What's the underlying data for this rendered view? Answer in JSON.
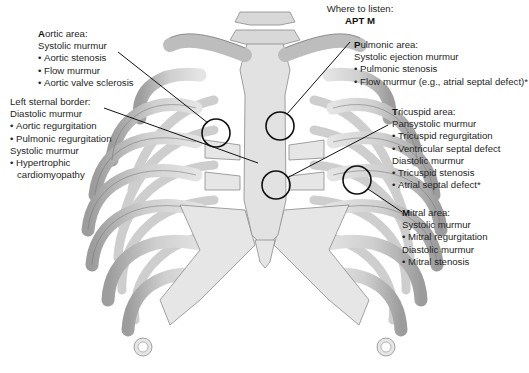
{
  "header": {
    "title": "Where to listen:",
    "mnemonic": "APT M"
  },
  "areas": {
    "aortic": {
      "initial": "A",
      "rest": "ortic area:",
      "lines": [
        {
          "text": "Systolic murmur",
          "bullet": false
        },
        {
          "text": "Aortic stenosis",
          "bullet": true
        },
        {
          "text": "Flow murmur",
          "bullet": true
        },
        {
          "text": "Aortic valve sclerosis",
          "bullet": true
        }
      ]
    },
    "left_sternal_border": {
      "initial": "",
      "rest": "Left sternal border:",
      "lines": [
        {
          "text": "Diastolic murmur",
          "bullet": false
        },
        {
          "text": "Aortic regurgitation",
          "bullet": true
        },
        {
          "text": "Pulmonic regurgitation",
          "bullet": true
        },
        {
          "text": "Systolic murmur",
          "bullet": false
        },
        {
          "text": "Hypertrophic",
          "bullet": true
        },
        {
          "text": "cardiomyopathy",
          "bullet": false
        }
      ]
    },
    "pulmonic": {
      "initial": "P",
      "rest": "ulmonic area:",
      "lines": [
        {
          "text": "Systolic ejection murmur",
          "bullet": false
        },
        {
          "text": "Pulmonic stenosis",
          "bullet": true
        },
        {
          "text": "Flow murmur (e.g., atrial septal defect)*",
          "bullet": true
        }
      ]
    },
    "tricuspid": {
      "initial": "T",
      "rest": "ricuspid area:",
      "lines": [
        {
          "text": "Pansystolic murmur",
          "bullet": false
        },
        {
          "text": "Tricuspid regurgitation",
          "bullet": true
        },
        {
          "text": "Ventricular septal defect",
          "bullet": true
        },
        {
          "text": "Diastolic murmur",
          "bullet": false
        },
        {
          "text": "Tricuspid stenosis",
          "bullet": true
        },
        {
          "text": "Atrial septal defect*",
          "bullet": true
        }
      ]
    },
    "mitral": {
      "initial": "M",
      "rest": "itral area:",
      "lines": [
        {
          "text": "Systolic murmur",
          "bullet": false
        },
        {
          "text": "Mitral regurgitation",
          "bullet": true
        },
        {
          "text": "Diastolic murmur",
          "bullet": false
        },
        {
          "text": "Mitral stenosis",
          "bullet": true
        }
      ]
    }
  },
  "colors": {
    "bone": "#dcdcdc",
    "bone_shadow": "#a9a9a9",
    "bone_outline": "#7a7a7a",
    "cartilage": "#e8e8e8",
    "leader": "#111111"
  }
}
